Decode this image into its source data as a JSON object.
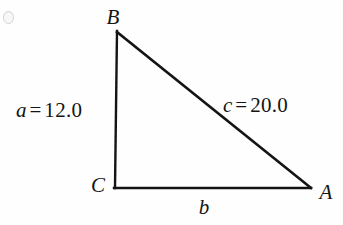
{
  "figure": {
    "type": "right-triangle-diagram",
    "background_color": "#fefefe",
    "stroke_color": "#141414",
    "vertices": [
      {
        "id": "B",
        "label": "B",
        "x": 117,
        "y": 31,
        "label_x": 113,
        "label_y": 17
      },
      {
        "id": "C",
        "label": "C",
        "x": 115,
        "y": 188,
        "label_x": 98,
        "label_y": 185
      },
      {
        "id": "A",
        "label": "A",
        "x": 310,
        "y": 188,
        "label_x": 326,
        "label_y": 192
      }
    ],
    "sides": [
      {
        "id": "a",
        "variable": "a",
        "equals": "=",
        "value": "12.0",
        "text": "a = 12.0",
        "from": "B",
        "to": "C",
        "label_x": 16,
        "label_y": 110
      },
      {
        "id": "c",
        "variable": "c",
        "equals": "=",
        "value": "20.0",
        "text": "c = 20.0",
        "from": "B",
        "to": "A",
        "label_x": 223,
        "label_y": 105
      },
      {
        "id": "b",
        "variable": "b",
        "equals": "",
        "value": "",
        "text": "b",
        "from": "C",
        "to": "A",
        "label_x": 204,
        "label_y": 207
      }
    ]
  }
}
